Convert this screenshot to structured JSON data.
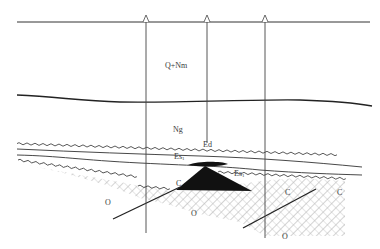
{
  "diagram": {
    "type": "geological-cross-section",
    "colors": {
      "line": "#333333",
      "hatch": "#9a9a9a",
      "fill_dark": "#111111",
      "background": "#ffffff"
    },
    "wells": [
      {
        "x": 146,
        "bottom_y": 233
      },
      {
        "x": 207,
        "bottom_y": 143
      },
      {
        "x": 265,
        "bottom_y": 238
      }
    ],
    "labels": {
      "q_nm": "Q+Nm",
      "ng": "Ng",
      "ed": "Ed",
      "es1_left": {
        "base": "Es",
        "sub": "1"
      },
      "es1_right": {
        "base": "Es",
        "sub": "1"
      },
      "c_left": "C",
      "c_mid": "C",
      "c_right": "C",
      "o_left": "O",
      "o_mid": "O",
      "o_right": "O"
    }
  }
}
